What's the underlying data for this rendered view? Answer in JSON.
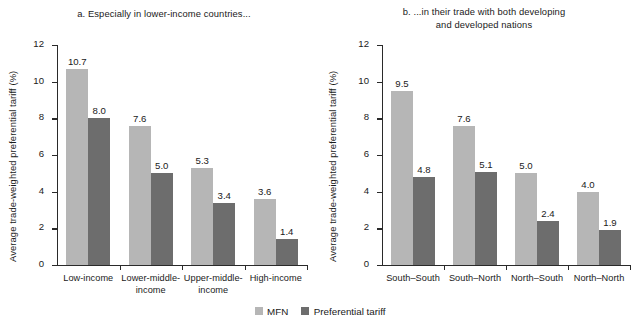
{
  "figure": {
    "legend": {
      "position": "bottom-center",
      "items": [
        {
          "label": "MFN",
          "color": "#b6b6b6",
          "swatch_name": "mfn-swatch"
        },
        {
          "label": "Preferential tariff",
          "color": "#6d6d6d",
          "swatch_name": "preferential-tariff-swatch"
        }
      ]
    }
  },
  "chart_data": [
    {
      "type": "bar",
      "panel": "a",
      "title": "a. Especially in lower-income countries...",
      "xlabel": "",
      "ylabel": "Average trade-weighted preferential tariff (%)",
      "ylim": [
        0,
        12
      ],
      "yticks": [
        "0",
        "2",
        "4",
        "6",
        "8",
        "10",
        "12"
      ],
      "grid": false,
      "categories": [
        "Low-income",
        "Lower-middle-\nincome",
        "Upper-middle-\nincome",
        "High-income"
      ],
      "series": [
        {
          "name": "MFN",
          "color": "#b6b6b6",
          "values": [
            10.7,
            7.6,
            5.3,
            3.6
          ],
          "labels": [
            "10.7",
            "7.6",
            "5.3",
            "3.6"
          ]
        },
        {
          "name": "Preferential tariff",
          "color": "#6d6d6d",
          "values": [
            8.0,
            5.0,
            3.4,
            1.4
          ],
          "labels": [
            "8.0",
            "5.0",
            "3.4",
            "1.4"
          ]
        }
      ]
    },
    {
      "type": "bar",
      "panel": "b",
      "title": "b. ...in their trade with both developing\nand developed nations",
      "xlabel": "",
      "ylabel": "Average trade-weighted preferential tariff (%)",
      "ylim": [
        0,
        12
      ],
      "yticks": [
        "0",
        "2",
        "4",
        "6",
        "8",
        "10",
        "12"
      ],
      "grid": false,
      "categories": [
        "South–South",
        "South–North",
        "North–South",
        "North–North"
      ],
      "series": [
        {
          "name": "MFN",
          "color": "#b6b6b6",
          "values": [
            9.5,
            7.6,
            5.0,
            4.0
          ],
          "labels": [
            "9.5",
            "7.6",
            "5.0",
            "4.0"
          ]
        },
        {
          "name": "Preferential tariff",
          "color": "#6d6d6d",
          "values": [
            4.8,
            5.1,
            2.4,
            1.9
          ],
          "labels": [
            "4.8",
            "5.1",
            "2.4",
            "1.9"
          ]
        }
      ]
    }
  ]
}
